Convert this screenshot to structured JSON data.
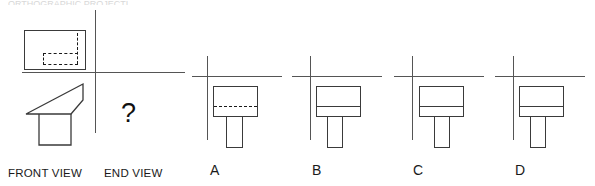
{
  "sheet": {
    "width": 595,
    "height": 186,
    "background": "#ffffff",
    "line_color": "#3a3a3a",
    "axis_color": "#555555",
    "hidden_line_color": "#1a1a1a",
    "text_color": "#1a1a1a",
    "cropped_header_text": "ORTHOGRAPHIC PROJECTION"
  },
  "question": {
    "prompt_symbol": "?",
    "given_views": [
      {
        "name": "top-view",
        "label": null,
        "description": "rectangle containing dashed hidden-detail lines forming an inner step"
      },
      {
        "name": "front-view",
        "label": "FRONT VIEW",
        "description": "wedge / angled solid above a rectangular base"
      }
    ],
    "missing_view": {
      "name": "end-view",
      "label": "END VIEW"
    }
  },
  "labels": {
    "front_view": "FRONT VIEW",
    "end_view": "END VIEW"
  },
  "options": [
    {
      "id": "A",
      "label": "A",
      "body_fill": "none",
      "internal_line_style": "dashed",
      "internal_line_position": "lower-third",
      "has_stem": true,
      "stem_alignment": "center"
    },
    {
      "id": "B",
      "label": "B",
      "body_fill": "none",
      "internal_line_style": "solid",
      "internal_line_position": "lower-third",
      "has_stem": true,
      "stem_alignment": "center-left"
    },
    {
      "id": "C",
      "label": "C",
      "body_fill": "none",
      "internal_line_style": "solid",
      "internal_line_position": "lower-third",
      "has_stem": true,
      "stem_alignment": "center"
    },
    {
      "id": "D",
      "label": "D",
      "body_fill": "none",
      "internal_line_style": "solid",
      "internal_line_position": "lower-third",
      "has_stem": true,
      "stem_alignment": "center-left"
    }
  ]
}
